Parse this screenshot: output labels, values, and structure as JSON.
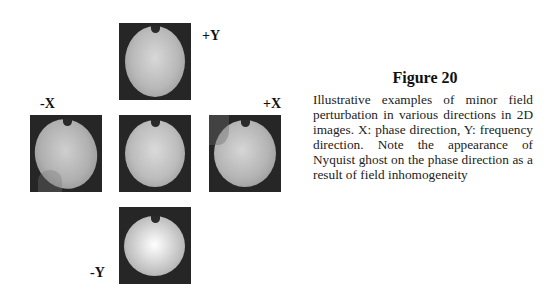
{
  "figure": {
    "title": "Figure 20",
    "caption": "Illustrative examples of minor field perturbation in various directions in 2D images.  X: phase direction, Y: frequency direction.  Note the appearance of Nyquist ghost on the phase direction as a result of field inhomogeneity"
  },
  "panels": [
    {
      "id": "plus-y",
      "label": "+Y"
    },
    {
      "id": "minus-x",
      "label": "-X"
    },
    {
      "id": "center",
      "label": ""
    },
    {
      "id": "plus-x",
      "label": "+X"
    },
    {
      "id": "minus-y",
      "label": "-Y"
    }
  ]
}
